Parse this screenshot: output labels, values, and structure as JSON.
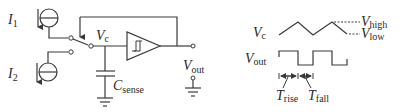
{
  "figure": {
    "type": "circuit-and-timing-diagram",
    "colors": {
      "line": "#3a3a3a",
      "text": "#2a2a2a",
      "background": "#ffffff"
    }
  },
  "circuit": {
    "sources": [
      {
        "id": "I1",
        "symbol": "I",
        "subscript": "1",
        "kind": "current-source-icon"
      },
      {
        "id": "I2",
        "symbol": "I",
        "subscript": "2",
        "kind": "current-source-icon"
      }
    ],
    "switch": {
      "kind": "spdt-switch-icon",
      "controlled_by": "Vout feedback"
    },
    "comparator": {
      "kind": "schmitt-trigger-icon"
    },
    "capacitor": {
      "symbol": "C",
      "subscript": "sense"
    },
    "node_vc": {
      "symbol": "V",
      "subscript": "c"
    },
    "output": {
      "symbol": "V",
      "subscript": "out"
    }
  },
  "timing": {
    "vc_label": {
      "symbol": "V",
      "subscript": "c"
    },
    "vout_label": {
      "symbol": "V",
      "subscript": "out"
    },
    "vhigh_label": {
      "symbol": "V",
      "subscript": "high"
    },
    "vlow_label": {
      "symbol": "V",
      "subscript": "low"
    },
    "trise_label": {
      "symbol": "T",
      "subscript": "rise"
    },
    "tfall_label": {
      "symbol": "T",
      "subscript": "fall"
    }
  }
}
